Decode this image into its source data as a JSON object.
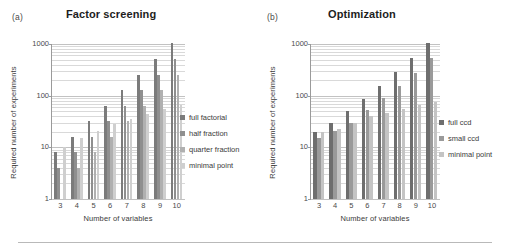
{
  "figure": {
    "bottom_rule": true
  },
  "panels": [
    {
      "label": "(a)",
      "title": "Factor screening",
      "xlabel": "Number of variables",
      "ylabel": "Required number of experiments",
      "legend": [
        {
          "name": "full factorial",
          "color": "#7b7b7b"
        },
        {
          "name": "half fraction",
          "color": "#8f8f8f"
        },
        {
          "name": "quarter fraction",
          "color": "#b0b0b0"
        },
        {
          "name": "minimal point",
          "color": "#cfcfcf"
        }
      ]
    },
    {
      "label": "(b)",
      "title": "Optimization",
      "xlabel": "Number of variables",
      "ylabel": "Required number of experiments",
      "legend": [
        {
          "name": "full ccd",
          "color": "#6e6e6e"
        },
        {
          "name": "small ccd",
          "color": "#9a9a9a"
        },
        {
          "name": "minimal point",
          "color": "#c4c4c4"
        }
      ]
    }
  ],
  "chart_data": [
    {
      "type": "bar",
      "title": "Factor screening",
      "panel_label": "(a)",
      "xlabel": "Number of variables",
      "ylabel": "Required number of experiments",
      "yscale": "log",
      "ylim": [
        1,
        1000
      ],
      "yticks": [
        1,
        10,
        100,
        1000
      ],
      "ytick_labels": [
        "1",
        "10",
        "100",
        "1000"
      ],
      "grid": true,
      "legend_position": "right",
      "categories": [
        "3",
        "4",
        "5",
        "6",
        "7",
        "8",
        "9",
        "10"
      ],
      "series": [
        {
          "name": "full factorial",
          "color": "#7b7b7b",
          "values": [
            8,
            16,
            32,
            64,
            128,
            256,
            512,
            1024
          ]
        },
        {
          "name": "half fraction",
          "color": "#8f8f8f",
          "values": [
            4,
            8,
            16,
            32,
            64,
            128,
            256,
            512
          ]
        },
        {
          "name": "quarter fraction",
          "color": "#b0b0b0",
          "values": [
            null,
            4,
            8,
            16,
            32,
            64,
            128,
            256
          ]
        },
        {
          "name": "minimal point",
          "color": "#cfcfcf",
          "values": [
            10,
            15,
            21,
            28,
            36,
            45,
            55,
            66
          ]
        }
      ]
    },
    {
      "type": "bar",
      "title": "Optimization",
      "panel_label": "(b)",
      "xlabel": "Number of variables",
      "ylabel": "Required number of experiments",
      "yscale": "log",
      "ylim": [
        1,
        1000
      ],
      "yticks": [
        1,
        10,
        100,
        1000
      ],
      "ytick_labels": [
        "1",
        "10",
        "100",
        "1000"
      ],
      "grid": true,
      "legend_position": "right",
      "categories": [
        "3",
        "4",
        "5",
        "6",
        "7",
        "8",
        "9",
        "10"
      ],
      "series": [
        {
          "name": "full ccd",
          "color": "#6e6e6e",
          "values": [
            20,
            30,
            50,
            86,
            152,
            282,
            540,
            1045
          ]
        },
        {
          "name": "small ccd",
          "color": "#9a9a9a",
          "values": [
            15,
            21,
            30,
            53,
            89,
            153,
            274,
            540
          ]
        },
        {
          "name": "minimal point",
          "color": "#c4c4c4",
          "values": [
            20,
            23,
            30,
            41,
            46,
            56,
            65,
            77
          ]
        }
      ]
    }
  ]
}
